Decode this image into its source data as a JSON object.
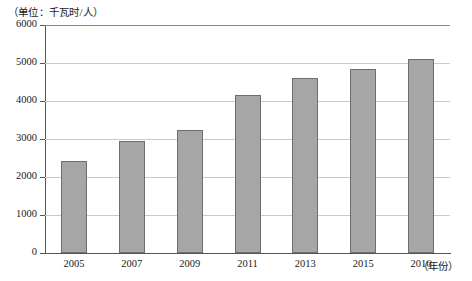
{
  "caption": {
    "unit_label": "（单位：千瓦时/人）"
  },
  "axes": {
    "x_unit_label": "（年份）",
    "y_ticks": [
      "0",
      "1000",
      "2000",
      "3000",
      "4000",
      "5000",
      "6000"
    ],
    "x_ticks": [
      "2005",
      "2007",
      "2009",
      "2011",
      "2013",
      "2015",
      "2016"
    ]
  },
  "style": {
    "bar_fill": "#a6a6a6",
    "bar_stroke": "#6e6e6e",
    "grid_color": "#c9c9c9",
    "axis_color": "#555555",
    "background": "#ffffff"
  },
  "chart_data": {
    "type": "bar",
    "title": "",
    "subtitle": "",
    "xlabel": "年份",
    "ylabel": "千瓦时/人",
    "unit": "千瓦时/人",
    "categories": [
      "2005",
      "2007",
      "2009",
      "2011",
      "2013",
      "2015",
      "2016"
    ],
    "values": [
      2420,
      2960,
      3230,
      4150,
      4600,
      4840,
      5100
    ],
    "ylim": [
      0,
      6000
    ],
    "yticks": [
      0,
      1000,
      2000,
      3000,
      4000,
      5000,
      6000
    ],
    "grid": true,
    "grid_axis": "y",
    "legend": false,
    "legend_position": "none",
    "series": [
      {
        "name": "人均用电量",
        "values": [
          2420,
          2960,
          3230,
          4150,
          4600,
          4840,
          5100
        ]
      }
    ]
  }
}
